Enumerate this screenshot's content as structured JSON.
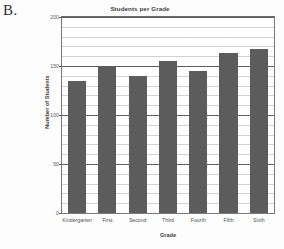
{
  "figure": {
    "panel_label": "B."
  },
  "chart_data": {
    "type": "bar",
    "title": "Students per Grade",
    "xlabel": "Grade",
    "ylabel": "Number of Students",
    "categories": [
      "Kindergarten",
      "First",
      "Second",
      "Third",
      "Fourth",
      "Fifth",
      "Sixth"
    ],
    "values": [
      135,
      150,
      140,
      155,
      145,
      163,
      167
    ],
    "ylim": [
      0,
      200
    ],
    "ytick_labels": [
      "0",
      "50",
      "100",
      "150",
      "200"
    ],
    "ytick_values": [
      0,
      50,
      100,
      150,
      200
    ],
    "minor_gridline_step": 10,
    "grid": true,
    "legend": false,
    "bar_color": "#5c5c5c",
    "gridline_color": "#d2d2d2",
    "axis_color": "#5f5f5f"
  }
}
